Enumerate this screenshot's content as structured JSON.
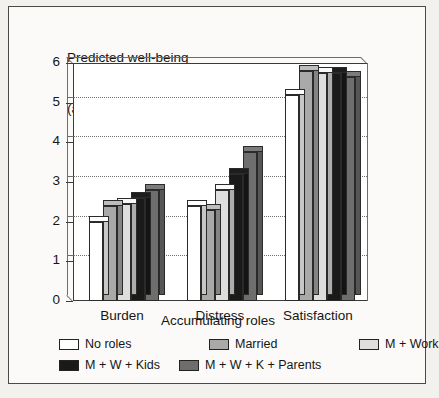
{
  "chart_data": {
    "type": "bar",
    "title": "Predicted well-being (assuming average values on controls)",
    "title_lines": [
      "Predicted well-being",
      "(assuming average values on controls)"
    ],
    "xlabel": "Accumulating roles",
    "ylabel": "",
    "ylim": [
      0,
      6
    ],
    "yticks": [
      0,
      1,
      2,
      3,
      4,
      5,
      6
    ],
    "ytick_labels": [
      "0",
      "1",
      "2",
      "3",
      "4",
      "5",
      "6"
    ],
    "grid": true,
    "gridlines": [
      1,
      2,
      3,
      4,
      5
    ],
    "legend_position": "bottom",
    "categories": [
      "Burden",
      "Distress",
      "Satisfaction"
    ],
    "series": [
      {
        "name": "No roles",
        "color": "#ffffff",
        "values": [
          2.0,
          2.4,
          5.2
        ]
      },
      {
        "name": "Married",
        "color": "#a9a9a9",
        "values": [
          2.4,
          2.3,
          5.8
        ]
      },
      {
        "name": "M + Work",
        "color": "#dedede",
        "values": [
          2.45,
          2.8,
          5.75
        ]
      },
      {
        "name": "M + W + Kids",
        "color": "#1a1a1a",
        "values": [
          2.6,
          3.2,
          5.75
        ]
      },
      {
        "name": "M + W + K + Parents",
        "color": "#6e6e6e",
        "values": [
          2.8,
          3.75,
          5.65
        ]
      }
    ]
  },
  "legend": {
    "row1": [
      "No roles",
      "Married",
      "M + Work"
    ],
    "row2": [
      "M + W + Kids",
      "M + W + K + Parents"
    ]
  }
}
